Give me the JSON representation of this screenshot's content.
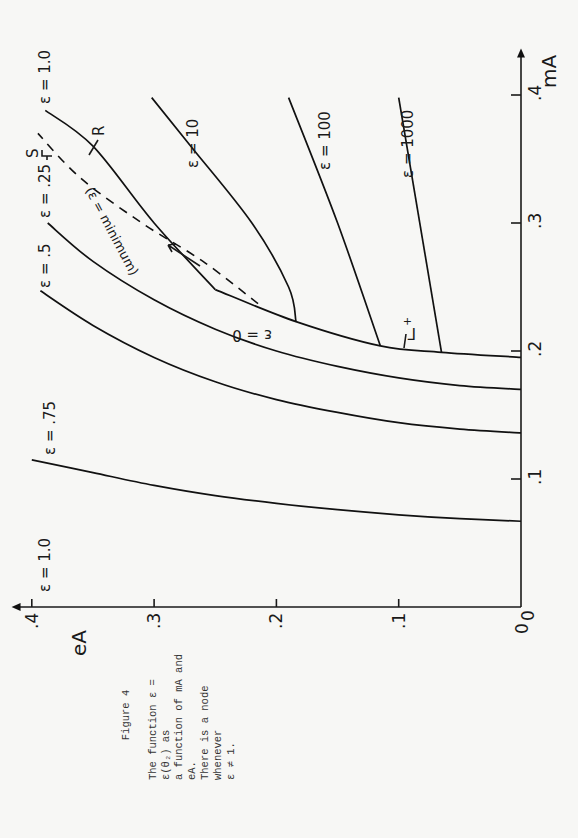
{
  "page": {
    "background": "#f7f7f5",
    "ink": "#111111",
    "orientation": "rotated 90deg counter-clockwise"
  },
  "caption": {
    "figure_label": "Figure 4",
    "lines": [
      "The function ε = ε(θ₂) as",
      "a function of mA and eA.",
      "There is a node whenever",
      "ε ≠ 1."
    ]
  },
  "chart_data": {
    "type": "line",
    "title": "Figure 4",
    "xlabel": "eA",
    "ylabel": "mA",
    "xlim": [
      0,
      0.4
    ],
    "ylim": [
      0,
      0.4
    ],
    "x_ticks": [
      "0",
      ".1",
      ".2",
      ".3",
      ".4"
    ],
    "y_ticks": [
      "0",
      ".1",
      ".2",
      ".3",
      ".4"
    ],
    "grid": false,
    "legend": "none (curves labeled inline)",
    "series": [
      {
        "name": "ε = .75",
        "x": [
          0.0,
          0.05,
          0.1,
          0.15,
          0.2,
          0.25,
          0.3,
          0.35,
          0.4
        ],
        "y": [
          0.067,
          0.069,
          0.072,
          0.076,
          0.081,
          0.087,
          0.095,
          0.105,
          0.115
        ]
      },
      {
        "name": "ε = .5",
        "x": [
          0.0,
          0.05,
          0.1,
          0.15,
          0.2,
          0.25,
          0.3,
          0.35,
          0.393
        ],
        "y": [
          0.136,
          0.139,
          0.144,
          0.152,
          0.162,
          0.176,
          0.195,
          0.22,
          0.247
        ]
      },
      {
        "name": "ε = .25",
        "x": [
          0.0,
          0.05,
          0.1,
          0.15,
          0.2,
          0.25,
          0.3,
          0.35,
          0.387
        ],
        "y": [
          0.17,
          0.173,
          0.179,
          0.188,
          0.2,
          0.217,
          0.24,
          0.27,
          0.3
        ]
      },
      {
        "name": "Γ+ (ε = 0 boundary)",
        "x": [
          0.0,
          0.065,
          0.115,
          0.184,
          0.25
        ],
        "y": [
          0.195,
          0.199,
          0.204,
          0.223,
          0.248
        ]
      },
      {
        "name": "ε = 1.0 (R)",
        "x": [
          0.25,
          0.3,
          0.35,
          0.389
        ],
        "y": [
          0.248,
          0.3,
          0.36,
          0.388
        ]
      },
      {
        "name": "ε = minimum (S, dashed)",
        "x": [
          0.215,
          0.26,
          0.31,
          0.36,
          0.395
        ],
        "y": [
          0.237,
          0.27,
          0.3,
          0.335,
          0.37
        ]
      },
      {
        "name": "ε = 10",
        "x": [
          0.184,
          0.19,
          0.22,
          0.27,
          0.302
        ],
        "y": [
          0.223,
          0.25,
          0.3,
          0.36,
          0.398
        ]
      },
      {
        "name": "ε = 100",
        "x": [
          0.115,
          0.15,
          0.19
        ],
        "y": [
          0.204,
          0.3,
          0.398
        ]
      },
      {
        "name": "ε = 1000",
        "x": [
          0.065,
          0.1
        ],
        "y": [
          0.199,
          0.398
        ]
      }
    ],
    "annotations": [
      "ε = 1.0 (at eA axis top-left)",
      "ε = 0",
      "Γ+",
      "R",
      "S",
      "(ε = minimum)"
    ]
  },
  "labels": {
    "eps_075": "ε = .75",
    "eps_05": "ε = .5",
    "eps_025": "ε = .25",
    "eps_1_top": "ε = 1.0",
    "eps_1_axis": "ε = 1.0",
    "eps_10": "ε = 10",
    "eps_100": "ε = 100",
    "eps_1000": "ε = 1000",
    "eps_0": "ε = 0",
    "eps_min": "(ε = minimum)",
    "gamma": "Γ",
    "gamma_sup": "+",
    "R": "R",
    "S": "S",
    "mA": "mA",
    "eA": "eA",
    "origin_x": "0",
    "origin_y": "0"
  }
}
